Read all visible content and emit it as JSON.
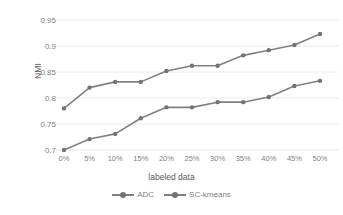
{
  "chart_data": {
    "type": "line",
    "title": "",
    "xlabel": "labeled data",
    "ylabel": "NMI",
    "categories": [
      "0%",
      "5%",
      "10%",
      "15%",
      "20%",
      "25%",
      "30%",
      "35%",
      "40%",
      "45%",
      "50%"
    ],
    "yticks": [
      "0.7",
      "0.75",
      "0.8",
      "0.85",
      "0.9",
      "0.95"
    ],
    "ytick_values": [
      0.7,
      0.75,
      0.8,
      0.85,
      0.9,
      0.95
    ],
    "ylim": [
      0.7,
      0.95
    ],
    "grid": true,
    "grid_axis": "y",
    "legend_position": "bottom",
    "series": [
      {
        "name": "ADC",
        "color": "#808080",
        "marker": "circle",
        "values": [
          0.7,
          0.721,
          0.731,
          0.761,
          0.782,
          0.782,
          0.792,
          0.792,
          0.802,
          0.823,
          0.833
        ]
      },
      {
        "name": "SC-kmeans",
        "color": "#808080",
        "marker": "circle",
        "values": [
          0.78,
          0.82,
          0.831,
          0.831,
          0.852,
          0.862,
          0.862,
          0.882,
          0.892,
          0.902,
          0.923
        ]
      }
    ]
  },
  "colors": {
    "line": "#808080",
    "marker": "#737373",
    "grid": "#e8e8e8",
    "tick_text": "#7f7f7f",
    "axis_title": "#595959",
    "background": "#ffffff"
  },
  "legend": {
    "items": [
      {
        "label": "ADC"
      },
      {
        "label": "SC-kmeans"
      }
    ]
  }
}
